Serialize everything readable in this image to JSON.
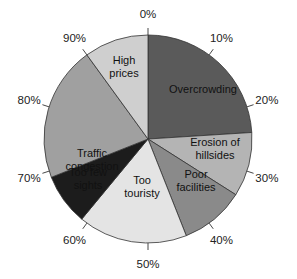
{
  "chart_data": {
    "type": "pie",
    "title": "",
    "start_angle": "12 o'clock, clockwise",
    "categories": [
      "Overcrowding",
      "Erosion of hillsides",
      "Poor facilities",
      "Too touristy",
      "Too few sights",
      "Traffic congestion",
      "High prices"
    ],
    "values": [
      24,
      10,
      10,
      17,
      8,
      21,
      10
    ],
    "unit": "%",
    "tick_labels": [
      "0%",
      "10%",
      "20%",
      "30%",
      "40%",
      "50%",
      "60%",
      "70%",
      "80%",
      "90%"
    ],
    "colors": [
      "#5a5a5a",
      "#b4b4b4",
      "#8a8a8a",
      "#e4e4e4",
      "#1c1c1c",
      "#a0a0a0",
      "#cfcfcf"
    ],
    "legend": "none (labels inside slices)"
  },
  "labels": {
    "s0": [
      "Overcrowding"
    ],
    "s1": [
      "Erosion of",
      "hillsides"
    ],
    "s2": [
      "Poor",
      "facilities"
    ],
    "s3": [
      "Too",
      "touristy"
    ],
    "s4": [
      "Too few",
      "sights"
    ],
    "s5": [
      "Traffic",
      "congestion"
    ],
    "s6": [
      "High",
      "prices"
    ]
  }
}
